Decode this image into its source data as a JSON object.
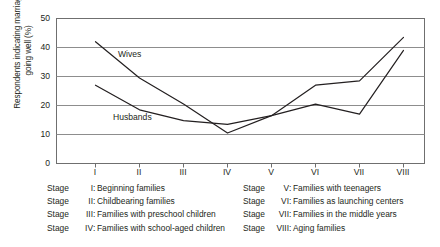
{
  "chart_data": {
    "type": "line",
    "title": "",
    "xlabel": "",
    "ylabel": "Respondents indicating marriage\ngoing well (%)",
    "categories": [
      "I",
      "II",
      "III",
      "IV",
      "V",
      "VI",
      "VII",
      "VIII"
    ],
    "ylim": [
      0,
      50
    ],
    "yticks": [
      0,
      10,
      20,
      30,
      40,
      50
    ],
    "grid": true,
    "legend_position": "inline-annotation",
    "series": [
      {
        "name": "Wives",
        "values": [
          42.0,
          29.5,
          20.5,
          10.5,
          16.5,
          27.0,
          28.5,
          43.5
        ]
      },
      {
        "name": "Husbands",
        "values": [
          27.0,
          18.5,
          14.8,
          13.5,
          16.5,
          20.5,
          17.0,
          39.0
        ]
      }
    ],
    "annotations": [
      {
        "text": "Wives",
        "x_frac": 0.185,
        "y_value": 35.5
      },
      {
        "text": "Husbands",
        "x_frac": 0.155,
        "y_value": 15.5
      }
    ]
  },
  "legend": {
    "left_column": [
      {
        "word": "Stage",
        "roman": "I",
        "colon": ":",
        "text": "Beginning families"
      },
      {
        "word": "Stage",
        "roman": "II",
        "colon": ":",
        "text": "Childbearing families"
      },
      {
        "word": "Stage",
        "roman": "III",
        "colon": ":",
        "text": "Families with preschool children"
      },
      {
        "word": "Stage",
        "roman": "IV",
        "colon": ":",
        "text": "Families with school-aged children"
      }
    ],
    "right_column": [
      {
        "word": "Stage",
        "roman": "V",
        "colon": ":",
        "text": "Families with teenagers"
      },
      {
        "word": "Stage",
        "roman": "VI",
        "colon": ":",
        "text": "Families as launching centers"
      },
      {
        "word": "Stage",
        "roman": "VII",
        "colon": ":",
        "text": "Families in the middle years"
      },
      {
        "word": "Stage",
        "roman": "VIII",
        "colon": ":",
        "text": "Aging families"
      }
    ]
  },
  "colors": {
    "ink": "#231f20",
    "grid": "#8d8d8d",
    "axis": "#6f6f6f",
    "line": "#231f20",
    "background": "#ffffff"
  }
}
